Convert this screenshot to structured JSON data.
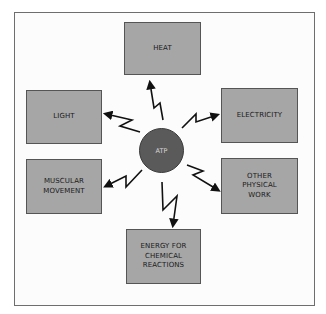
{
  "diagram": {
    "center": {
      "label": "ATP",
      "color": "#5a5a5a"
    },
    "box_color": "#a6a6a6",
    "outputs": [
      {
        "id": "heat",
        "label": "HEAT"
      },
      {
        "id": "light",
        "label": "LIGHT"
      },
      {
        "id": "electricity",
        "label": "ELECTRICITY"
      },
      {
        "id": "muscular-movement",
        "label": "MUSCULAR\nMOVEMENT"
      },
      {
        "id": "other-physical-work",
        "label": "OTHER\nPHYSICAL\nWORK"
      },
      {
        "id": "energy-for-chemical-reactions",
        "label": "ENERGY FOR\nCHEMICAL\nREACTIONS"
      }
    ]
  }
}
